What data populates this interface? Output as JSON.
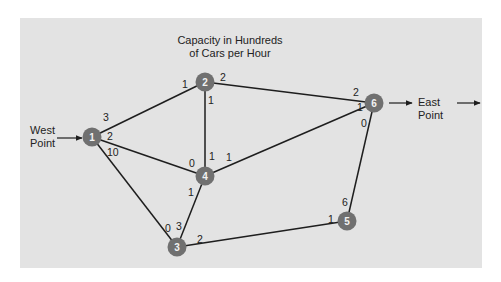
{
  "title_line1": "Capacity in Hundreds",
  "title_line2": "of Cars per Hour",
  "source": {
    "label_line1": "West",
    "label_line2": "Point"
  },
  "sink": {
    "label_line1": "East",
    "label_line2": "Point"
  },
  "colors": {
    "panel": "#e3e3e3",
    "node": "#707070",
    "edge": "#1e1e1e",
    "node_text": "#f2f2f2"
  },
  "nodes": [
    {
      "id": "1",
      "label": "1"
    },
    {
      "id": "2",
      "label": "2"
    },
    {
      "id": "3",
      "label": "3"
    },
    {
      "id": "4",
      "label": "4"
    },
    {
      "id": "5",
      "label": "5"
    },
    {
      "id": "6",
      "label": "6"
    }
  ],
  "edges": [
    {
      "from": "1",
      "to": "2",
      "cap_from": "3",
      "cap_to": "1"
    },
    {
      "from": "1",
      "to": "4",
      "cap_from": "2",
      "cap_to": "0"
    },
    {
      "from": "1",
      "to": "3",
      "cap_from": "10",
      "cap_to": "0"
    },
    {
      "from": "2",
      "to": "6",
      "cap_from": "2",
      "cap_to": "2"
    },
    {
      "from": "2",
      "to": "4",
      "cap_from": "1",
      "cap_to": "1"
    },
    {
      "from": "4",
      "to": "6",
      "cap_from": "1",
      "cap_to": "1"
    },
    {
      "from": "4",
      "to": "3",
      "cap_from": "1",
      "cap_to": "3"
    },
    {
      "from": "3",
      "to": "5",
      "cap_from": "2",
      "cap_to": "1"
    },
    {
      "from": "5",
      "to": "6",
      "cap_from": "6",
      "cap_to": "0"
    }
  ]
}
